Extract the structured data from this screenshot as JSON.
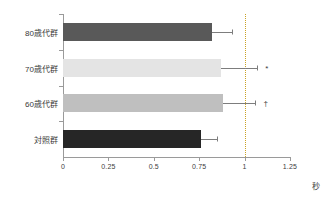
{
  "chart_data": {
    "type": "bar",
    "orientation": "horizontal",
    "title": "",
    "xlabel": "秒",
    "ylabel": "",
    "xlim": [
      0,
      1.25
    ],
    "xticks": [
      "0",
      "0.25",
      "0.5",
      "0.75",
      "1",
      "1.25"
    ],
    "xtick_values": [
      0,
      0.25,
      0.5,
      0.75,
      1,
      1.25
    ],
    "grid": false,
    "legend": "none",
    "reference_line": {
      "value": 1,
      "style": "dotted",
      "color": "#c9a227"
    },
    "categories": [
      "80歳代群",
      "70歳代群",
      "60歳代群",
      "対照群"
    ],
    "values": [
      0.82,
      0.87,
      0.88,
      0.76
    ],
    "errors_upper": [
      0.93,
      1.07,
      1.06,
      0.85
    ],
    "bar_colors": [
      "#595959",
      "#e4e4e4",
      "#bfbfbf",
      "#262626"
    ],
    "annotations": [
      "",
      "*",
      "†",
      ""
    ],
    "bars": [
      {
        "category": "80歳代群",
        "value": 0.82,
        "error_upper": 0.93,
        "color": "#595959",
        "annotation": ""
      },
      {
        "category": "70歳代群",
        "value": 0.87,
        "error_upper": 1.07,
        "color": "#e4e4e4",
        "annotation": "*"
      },
      {
        "category": "60歳代群",
        "value": 0.88,
        "error_upper": 1.06,
        "color": "#bfbfbf",
        "annotation": "†"
      },
      {
        "category": "対照群",
        "value": 0.76,
        "error_upper": 0.85,
        "color": "#262626",
        "annotation": ""
      }
    ]
  }
}
